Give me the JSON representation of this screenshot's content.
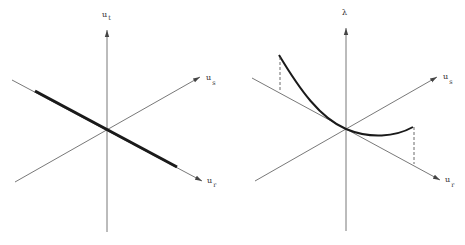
{
  "figure": {
    "panels": [
      {
        "id": "left",
        "axes": {
          "vertical": {
            "label": "u",
            "subscript": "t"
          },
          "upper_right": {
            "label": "u",
            "subscript": "s"
          },
          "lower_right": {
            "label": "u",
            "subscript": "r"
          }
        },
        "curve": "thick straight line along u_r axis through origin"
      },
      {
        "id": "right",
        "axes": {
          "vertical": {
            "label": "λ",
            "subscript": ""
          },
          "upper_right": {
            "label": "u",
            "subscript": "s"
          },
          "lower_right": {
            "label": "u",
            "subscript": "r"
          }
        },
        "curve": "thick curve through origin with dashed projections to u_r axis"
      }
    ],
    "colors": {
      "axis": "#555555",
      "curve": "#1a1a1a",
      "background": "#ffffff"
    }
  }
}
